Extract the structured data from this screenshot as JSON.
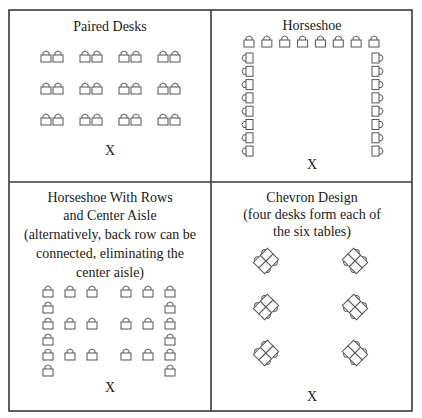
{
  "figure": {
    "colors": {
      "line": "#3a3a3a",
      "background": "#ffffff",
      "text": "#1a1a1a"
    },
    "panels": [
      {
        "id": "paired-desks",
        "title_lines": [
          "Paired Desks"
        ],
        "teacher_marker": "X",
        "desk_rows": 3,
        "desk_pairs_per_row": 4
      },
      {
        "id": "horseshoe",
        "title_lines": [
          "Horseshoe"
        ],
        "teacher_marker": "X",
        "top_row_desks": 8,
        "side_column_desks": 8
      },
      {
        "id": "horseshoe-rows-aisle",
        "title_lines": [
          "Horseshoe With Rows",
          "and Center Aisle",
          "(alternatively, back row can be",
          "connected, eliminating the",
          "center aisle)"
        ],
        "teacher_marker": "X",
        "row_groups": 3,
        "desks_per_side_per_row": 3
      },
      {
        "id": "chevron-design",
        "title_lines": [
          "Chevron Design",
          "(four desks form each of",
          "the six tables)"
        ],
        "teacher_marker": "X",
        "tables": 6,
        "desks_per_table": 4
      }
    ]
  }
}
